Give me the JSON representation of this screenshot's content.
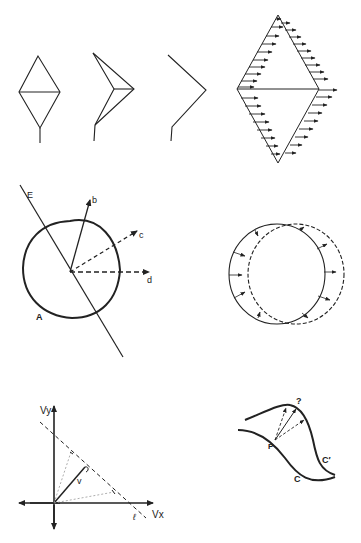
{
  "figure": {
    "panels": [
      {
        "id": "rhombus-sequence",
        "description": "Rhombus deforming: rhombus with stem, folded rhombus, bent line"
      },
      {
        "id": "rhombus-flow-field",
        "description": "Rhombus with horizontal arrows along its edges"
      },
      {
        "id": "circle-vectors",
        "labels": {
          "line": "E",
          "vec_b": "b",
          "vec_c": "c",
          "vec_d": "d",
          "circle": "A"
        }
      },
      {
        "id": "circle-displacement",
        "description": "Solid circle and dashed shifted circle with displacement arrows"
      },
      {
        "id": "velocity-space",
        "labels": {
          "y_axis": "Vy",
          "x_axis": "Vx",
          "vector": "v",
          "line": "ℓ"
        }
      },
      {
        "id": "curve-correspondence",
        "labels": {
          "point": "P",
          "question": "?",
          "curve": "C",
          "curve_prime": "C′"
        }
      }
    ]
  },
  "colors": {
    "stroke": "#222222",
    "background": "#ffffff",
    "faint": "#999999"
  }
}
